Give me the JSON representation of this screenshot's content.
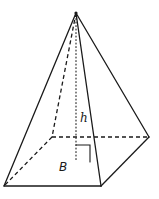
{
  "diagram": {
    "labels": {
      "height": "h",
      "base": "B"
    },
    "vertices": {
      "apex": [
        76,
        13
      ],
      "front_left": [
        4,
        186
      ],
      "front_right": [
        101,
        186
      ],
      "back_right": [
        149,
        137
      ],
      "back_left": [
        52,
        137
      ],
      "base_foot": [
        76,
        162
      ]
    },
    "colors": {
      "stroke": "#1a1a1a",
      "background": "#ffffff"
    }
  }
}
